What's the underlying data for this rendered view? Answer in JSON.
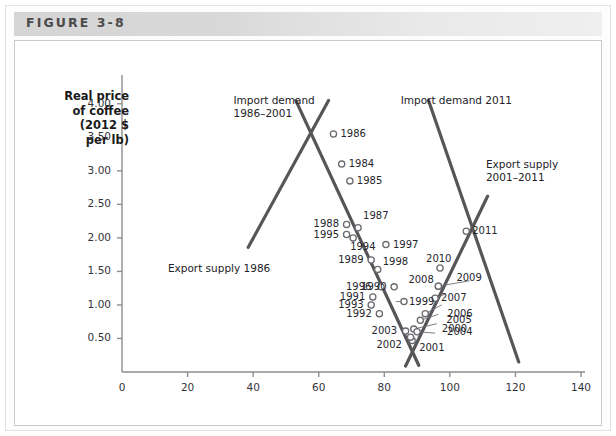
{
  "figure": {
    "header_label": "FIGURE 3-8"
  },
  "chart_data": {
    "type": "scatter",
    "title": "",
    "xlabel": "Quantity of coffee (millions of 60-kilo bags)",
    "ylabel": "Real price of coffee (2012 $ per lb)",
    "ylabel_lines": [
      "Real price",
      "of coffee",
      "(2012 $",
      "per lb)"
    ],
    "xlim": [
      0,
      140
    ],
    "ylim": [
      0,
      4.25
    ],
    "xticks": [
      0,
      20,
      40,
      60,
      80,
      100,
      120,
      140
    ],
    "xtick_labels": [
      "0",
      "20",
      "40",
      "60",
      "80",
      "100",
      "120",
      "140"
    ],
    "yticks": [
      0.5,
      1.0,
      1.5,
      2.0,
      2.5,
      3.0,
      3.5,
      4.0
    ],
    "ytick_labels": [
      "0.50",
      "1.00",
      "1.50",
      "2.00",
      "2.50",
      "3.00",
      "3.50",
      "4.00"
    ],
    "grid": false,
    "legend_position": "inline-annotations",
    "line_color": "#565659",
    "marker_color": "#6b6b70",
    "points": [
      {
        "label": "1984",
        "x": 67.0,
        "y": 3.1,
        "label_dx": 7,
        "label_dy": -6
      },
      {
        "label": "1985",
        "x": 69.5,
        "y": 2.85,
        "label_dx": 7,
        "label_dy": -6
      },
      {
        "label": "1986",
        "x": 64.5,
        "y": 3.55,
        "label_dx": 7,
        "label_dy": -6
      },
      {
        "label": "1987",
        "x": 72.0,
        "y": 2.15,
        "label_dx": 5,
        "label_dy": -18
      },
      {
        "label": "1988",
        "x": 68.5,
        "y": 2.2,
        "label_dx": -33,
        "label_dy": -6
      },
      {
        "label": "1989",
        "x": 76.0,
        "y": 1.67,
        "label_dx": -33,
        "label_dy": -6
      },
      {
        "label": "1990",
        "x": 83.0,
        "y": 1.27,
        "label_dx": -33,
        "label_dy": -6
      },
      {
        "label": "1991",
        "x": 76.5,
        "y": 1.12,
        "label_dx": -33,
        "label_dy": -6
      },
      {
        "label": "1992",
        "x": 78.5,
        "y": 0.87,
        "label_dx": -33,
        "label_dy": -6
      },
      {
        "label": "1993",
        "x": 76.0,
        "y": 1.0,
        "label_dx": -33,
        "label_dy": -6
      },
      {
        "label": "1994",
        "x": 70.5,
        "y": 2.0,
        "label_dx": -3,
        "label_dy": 3
      },
      {
        "label": "1995",
        "x": 68.5,
        "y": 2.05,
        "label_dx": -33,
        "label_dy": -6
      },
      {
        "label": "1996",
        "x": 79.0,
        "y": 1.27,
        "label_dx": -35,
        "label_dy": -6
      },
      {
        "label": "1997",
        "x": 80.5,
        "y": 1.9,
        "label_dx": 7,
        "label_dy": -6
      },
      {
        "label": "1998",
        "x": 78.0,
        "y": 1.53,
        "label_dx": 5,
        "label_dy": -13
      },
      {
        "label": "1999",
        "x": 86.0,
        "y": 1.05,
        "label_dx": 5,
        "label_dy": -6
      },
      {
        "label": "2000",
        "x": 89.0,
        "y": 0.64,
        "label_dx": 28,
        "label_dy": -6
      },
      {
        "label": "2001",
        "x": 88.5,
        "y": 0.47,
        "label_dx": 7,
        "label_dy": 2
      },
      {
        "label": "2002",
        "x": 88.0,
        "y": 0.52,
        "label_dx": -34,
        "label_dy": 2
      },
      {
        "label": "2003",
        "x": 86.5,
        "y": 0.61,
        "label_dx": -34,
        "label_dy": -6
      },
      {
        "label": "2004",
        "x": 90.0,
        "y": 0.6,
        "label_dx": 30,
        "label_dy": -6
      },
      {
        "label": "2005",
        "x": 91.0,
        "y": 0.77,
        "label_dx": 26,
        "label_dy": -6
      },
      {
        "label": "2006",
        "x": 92.5,
        "y": 0.87,
        "label_dx": 22,
        "label_dy": -6
      },
      {
        "label": "2007",
        "x": 95.5,
        "y": 1.1,
        "label_dx": 6,
        "label_dy": -6
      },
      {
        "label": "2008",
        "x": 96.5,
        "y": 1.28,
        "label_dx": -30,
        "label_dy": -12
      },
      {
        "label": "2009",
        "x": 96.5,
        "y": 1.28,
        "label_dx": 18,
        "label_dy": -14
      },
      {
        "label": "2010",
        "x": 97.0,
        "y": 1.55,
        "label_dx": -14,
        "label_dy": -15
      },
      {
        "label": "2011",
        "x": 105.0,
        "y": 2.1,
        "label_dx": 6,
        "label_dy": -6
      }
    ],
    "curves": [
      {
        "name": "import-demand-1986-2001",
        "label_lines": [
          "Import demand",
          "1986–2001"
        ],
        "label_x": 34.0,
        "label_y": 4.05,
        "x1": 53.0,
        "y1": 4.05,
        "x2": 90.5,
        "y2": 0.1
      },
      {
        "name": "export-supply-1986",
        "label_lines": [
          "Export supply 1986"
        ],
        "label_x": 14.0,
        "label_y": 1.55,
        "x1": 38.5,
        "y1": 1.86,
        "x2": 63.0,
        "y2": 4.05
      },
      {
        "name": "import-demand-2011",
        "label_lines": [
          "Import demand 2011"
        ],
        "label_x": 85.0,
        "label_y": 4.05,
        "x1": 93.5,
        "y1": 4.05,
        "x2": 121.0,
        "y2": 0.15
      },
      {
        "name": "export-supply-2001-2011",
        "label_lines": [
          "Export supply",
          "2001–2011"
        ],
        "label_x": 111.0,
        "label_y": 3.1,
        "x1": 86.5,
        "y1": 0.09,
        "x2": 111.5,
        "y2": 2.62
      }
    ]
  }
}
